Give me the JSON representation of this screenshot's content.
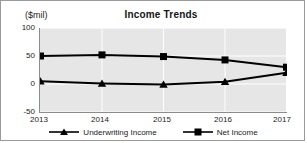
{
  "chart_data": {
    "type": "line",
    "title": "Income Trends",
    "ylabel": "($mil)",
    "xlabel": "",
    "categories": [
      "2013",
      "2014",
      "2015",
      "2016",
      "2017"
    ],
    "x": [
      2013,
      2014,
      2015,
      2016,
      2017
    ],
    "ylim": [
      -50,
      100
    ],
    "yticks": [
      100,
      50,
      0,
      -50
    ],
    "ytick_labels": [
      "100",
      "50",
      "0",
      "-50"
    ],
    "grid": true,
    "legend_position": "bottom",
    "series": [
      {
        "name": "Underwriting Income",
        "marker": "triangle",
        "color": "#000000",
        "values": [
          5,
          1,
          -1,
          4,
          20
        ]
      },
      {
        "name": "Net Income",
        "marker": "square",
        "color": "#000000",
        "values": [
          50,
          52,
          49,
          43,
          30
        ]
      }
    ]
  },
  "legend": {
    "items": [
      {
        "label": "Underwriting Income",
        "marker": "triangle-marker-icon"
      },
      {
        "label": "Net Income",
        "marker": "square-marker-icon"
      }
    ]
  }
}
